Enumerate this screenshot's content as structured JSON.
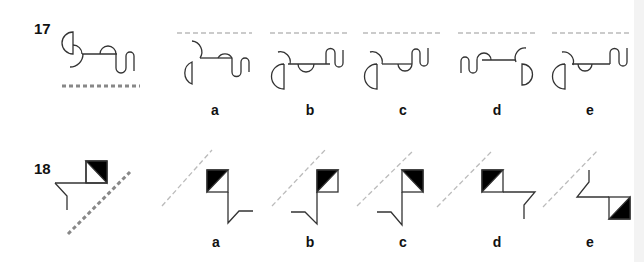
{
  "questions": [
    {
      "number": "17",
      "options": [
        "a",
        "b",
        "c",
        "d",
        "e"
      ]
    },
    {
      "number": "18",
      "options": [
        "a",
        "b",
        "c",
        "d",
        "e"
      ]
    }
  ],
  "colors": {
    "stroke": "#333333",
    "mirror_line": "#999999",
    "mirror_line_light": "#bbbbbb",
    "fill": "#000000"
  }
}
